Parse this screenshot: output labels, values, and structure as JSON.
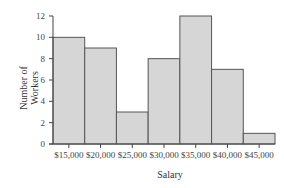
{
  "chart_data": {
    "type": "bar",
    "subtype": "histogram",
    "title": "",
    "xlabel": "Salary",
    "ylabel": "Number of Workers",
    "ylabel_lines": [
      "Number of",
      "Workers"
    ],
    "categories": [
      "$15,000",
      "$20,000",
      "$25,000",
      "$30,000",
      "$35,000",
      "$40,000",
      "$45,000"
    ],
    "values": [
      10,
      9,
      3,
      8,
      12,
      7,
      1
    ],
    "ylim": [
      0,
      12
    ],
    "yticks": [
      0,
      2,
      4,
      6,
      8,
      10,
      12
    ],
    "grid": false,
    "legend": null,
    "colors": {
      "bar_fill": "#d6d6d6",
      "bar_stroke": "#555555",
      "axis": "#444444"
    }
  }
}
